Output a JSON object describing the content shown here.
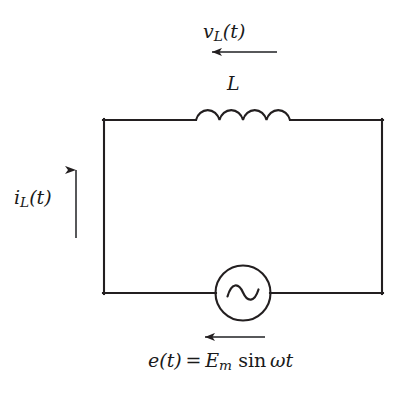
{
  "diagram": {
    "type": "electrical-schematic",
    "stroke_color": "#231f20",
    "background_color": "#ffffff"
  },
  "labels": {
    "voltage": {
      "name": "inductor-voltage-label",
      "text": "v_L(t)",
      "main": "v",
      "subscript": "L",
      "suffix": "(t)"
    },
    "inductor": {
      "name": "inductor-label",
      "text": "L"
    },
    "current": {
      "name": "inductor-current-label",
      "text": "i_L(t)",
      "main": "i",
      "subscript": "L",
      "suffix": "(t)"
    },
    "source": {
      "name": "source-voltage-equation",
      "text": "e(t) = E_m sin wt",
      "lhs_main": "e",
      "lhs_suffix": "(t)",
      "equals": "=",
      "amplitude_main": "E",
      "amplitude_subscript": "m",
      "function": "sin",
      "omega": "ω",
      "time": "t"
    }
  },
  "components": {
    "inductor": {
      "name": "inductor-coil",
      "humps": 4,
      "symbol": "coil"
    },
    "ac_source": {
      "name": "ac-source",
      "symbol": "sine-wave-in-circle",
      "glyph": "~"
    }
  },
  "arrows": {
    "voltage_arrow": {
      "name": "voltage-direction-arrow",
      "direction": "left"
    },
    "current_arrow": {
      "name": "current-direction-arrow",
      "direction": "up"
    },
    "source_arrow": {
      "name": "source-polarity-arrow",
      "direction": "left"
    }
  }
}
